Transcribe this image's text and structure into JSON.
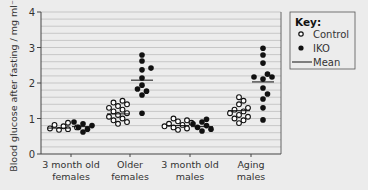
{
  "chart_data": {
    "type": "scatter",
    "title": "",
    "xlabel": "",
    "ylabel": "Blood glucose after fasting / mg ml⁻¹",
    "ylim": [
      0,
      4
    ],
    "yticks": [
      0,
      1,
      2,
      3,
      4
    ],
    "grid": {
      "horizontal": true,
      "minor_step": 0.2
    },
    "categories": [
      "3 month old\nfemales",
      "Older\nfemales",
      "3 month old\nmales",
      "Aging\nmales"
    ],
    "legend": {
      "title": "Key:",
      "position": "right",
      "entries": [
        "Control",
        "IKO",
        "Mean"
      ]
    },
    "series": [
      {
        "name": "Control",
        "marker": "open-circle",
        "values": [
          [
            0.68,
            0.7,
            0.72,
            0.75,
            0.78,
            0.82,
            0.88
          ],
          [
            0.85,
            0.9,
            0.95,
            1.0,
            1.05,
            1.1,
            1.15,
            1.2,
            1.25,
            1.3,
            1.35,
            1.4,
            1.45,
            1.5
          ],
          [
            0.68,
            0.72,
            0.75,
            0.78,
            0.82,
            0.85,
            0.88,
            0.92,
            0.95,
            1.0
          ],
          [
            0.87,
            0.95,
            1.0,
            1.05,
            1.1,
            1.15,
            1.2,
            1.25,
            1.3,
            1.4,
            1.5,
            1.6
          ]
        ],
        "means": [
          0.73,
          1.13,
          0.8,
          1.22
        ]
      },
      {
        "name": "IKO",
        "marker": "filled-circle",
        "values": [
          [
            0.62,
            0.7,
            0.75,
            0.8,
            0.85,
            0.9
          ],
          [
            1.15,
            1.66,
            1.77,
            1.83,
            1.94,
            2.14,
            2.37,
            2.42,
            2.62,
            2.79
          ],
          [
            0.65,
            0.7,
            0.75,
            0.8,
            0.85,
            0.9,
            0.98
          ],
          [
            0.96,
            1.3,
            1.55,
            1.69,
            1.86,
            2.11,
            2.17,
            2.17,
            2.25,
            2.56,
            2.79,
            2.98
          ]
        ],
        "means": [
          0.77,
          2.08,
          0.77,
          2.03
        ]
      }
    ]
  },
  "axis": {
    "y_ticks": [
      "0",
      "1",
      "2",
      "3",
      "4"
    ],
    "ylabel": "Blood glucose after fasting / mg ml⁻¹",
    "x_labels": [
      {
        "line1": "3 month old",
        "line2": "females"
      },
      {
        "line1": "Older",
        "line2": "females"
      },
      {
        "line1": "3 month old",
        "line2": "males"
      },
      {
        "line1": "Aging",
        "line2": "males"
      }
    ]
  },
  "key": {
    "title": "Key:",
    "control": "Control",
    "iko": "IKO",
    "mean": "Mean"
  },
  "colors": {
    "background": "#ececec",
    "grid": "#b8b8b8",
    "axis": "#444444",
    "marker": "#111111",
    "marker_fill_open": "#ffffff"
  }
}
